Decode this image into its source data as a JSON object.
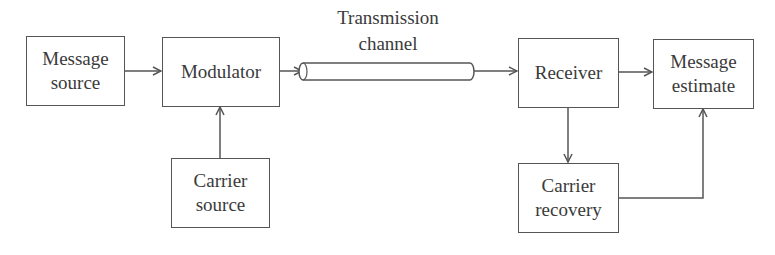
{
  "diagram": {
    "title": "",
    "blocks": {
      "message_source": {
        "line1": "Message",
        "line2": "source"
      },
      "modulator": {
        "line1": "Modulator"
      },
      "carrier_source": {
        "line1": "Carrier",
        "line2": "source"
      },
      "channel": {
        "line1": "Transmission",
        "line2": "channel"
      },
      "receiver": {
        "line1": "Receiver"
      },
      "message_estimate": {
        "line1": "Message",
        "line2": "estimate"
      },
      "carrier_recovery": {
        "line1": "Carrier",
        "line2": "recovery"
      }
    },
    "edges": [
      {
        "from": "Message source",
        "to": "Modulator"
      },
      {
        "from": "Carrier source",
        "to": "Modulator"
      },
      {
        "from": "Modulator",
        "to": "Transmission channel"
      },
      {
        "from": "Transmission channel",
        "to": "Receiver"
      },
      {
        "from": "Receiver",
        "to": "Message estimate"
      },
      {
        "from": "Receiver",
        "to": "Carrier recovery"
      },
      {
        "from": "Carrier recovery",
        "to": "Message estimate"
      }
    ],
    "colors": {
      "line": "#555555",
      "text": "#3a3a3a",
      "background": "#ffffff"
    }
  }
}
